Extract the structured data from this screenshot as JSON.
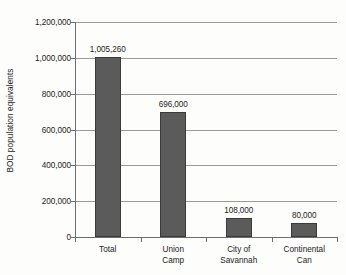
{
  "chart_data": {
    "type": "bar",
    "title": "",
    "xlabel": "",
    "ylabel": "BOD population equivalents",
    "categories": [
      "Total",
      "Union Camp",
      "City of Savannah",
      "Continental Can"
    ],
    "values": [
      1005260,
      696000,
      108000,
      80000
    ],
    "value_labels": [
      "1,005,260",
      "696,000",
      "108,000",
      "80,000"
    ],
    "ylim": [
      0,
      1200000
    ],
    "ytick_values": [
      0,
      200000,
      400000,
      600000,
      800000,
      1000000,
      1200000
    ],
    "ytick_labels": [
      "0",
      "200,000",
      "400,000",
      "600,000",
      "800,000",
      "1,000,000",
      "1,200,000"
    ],
    "grid": true,
    "legend": false,
    "bar_color": "#5b5b5b",
    "bar_outline_color": "#3a3a3a",
    "gridline_color": "#9a9a9a",
    "axis_color": "#6e6e6e",
    "background_color": "#fdfdfb",
    "category_lines": [
      [
        "Total"
      ],
      [
        "Union",
        "Camp"
      ],
      [
        "City of",
        "Savannah"
      ],
      [
        "Continental",
        "Can"
      ]
    ]
  }
}
